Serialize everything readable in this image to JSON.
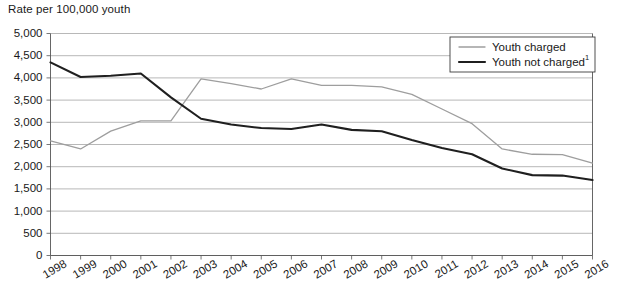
{
  "axis_title": "Rate per 100,000 youth",
  "colors": {
    "youth_charged": "#9e9e9e",
    "youth_not_charged": "#1f1f1f",
    "gridline": "#9a9a9a",
    "axis": "#555555",
    "text": "#191919",
    "background": "#ffffff"
  },
  "legend": {
    "position": "top-right",
    "entries": [
      {
        "label": "Youth charged",
        "superscript": "",
        "color": "#9e9e9e",
        "width": 1.3
      },
      {
        "label": "Youth not charged",
        "superscript": "1",
        "color": "#1f1f1f",
        "width": 2.1
      }
    ]
  },
  "chart_data": {
    "type": "line",
    "title": "",
    "subtitle": "",
    "xlabel": "",
    "ylabel": "Rate per 100,000 youth",
    "grid": true,
    "legend_position": "top-right",
    "ylim": [
      0,
      5000
    ],
    "ytick_step": 500,
    "ytick_labels": [
      "0",
      "500",
      "1,000",
      "1,500",
      "2,000",
      "2,500",
      "3,000",
      "3,500",
      "4,000",
      "4,500",
      "5,000"
    ],
    "ytick_values": [
      0,
      500,
      1000,
      1500,
      2000,
      2500,
      3000,
      3500,
      4000,
      4500,
      5000
    ],
    "x": [
      1998,
      1999,
      2000,
      2001,
      2002,
      2003,
      2004,
      2005,
      2006,
      2007,
      2008,
      2009,
      2010,
      2011,
      2012,
      2013,
      2014,
      2015,
      2016
    ],
    "categories": [
      "1998",
      "1999",
      "2000",
      "2001",
      "2002",
      "2003",
      "2004",
      "2005",
      "2006",
      "2007",
      "2008",
      "2009",
      "2010",
      "2011",
      "2012",
      "2013",
      "2014",
      "2015",
      "2016"
    ],
    "series": [
      {
        "name": "Youth charged",
        "color": "#9e9e9e",
        "values": [
          2580,
          2400,
          2800,
          3030,
          3030,
          3980,
          3870,
          3750,
          3980,
          3830,
          3830,
          3800,
          3630,
          3300,
          2970,
          2400,
          2280,
          2270,
          2080
        ]
      },
      {
        "name": "Youth not charged",
        "color": "#1f1f1f",
        "values": [
          4350,
          4020,
          4050,
          4100,
          3560,
          3080,
          2950,
          2870,
          2850,
          2950,
          2830,
          2800,
          2600,
          2420,
          2280,
          1960,
          1810,
          1800,
          1700
        ]
      }
    ]
  }
}
